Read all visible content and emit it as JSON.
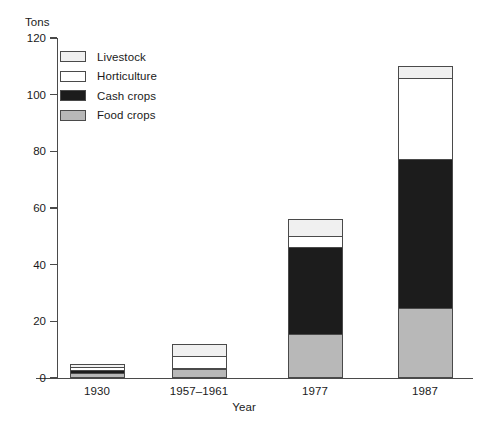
{
  "chart_data": {
    "type": "bar",
    "subtype": "stacked-bar",
    "title": "",
    "xlabel": "Year",
    "ylabel": "Tons",
    "ylim": [
      0,
      120
    ],
    "yticks": [
      0,
      20,
      40,
      60,
      80,
      100,
      120
    ],
    "ytick_labels": [
      "0",
      "20",
      "40",
      "60",
      "80",
      "100",
      "120"
    ],
    "grid": false,
    "legend_position": "upper left",
    "categories": [
      "1930",
      "1957–1961",
      "1977",
      "1987"
    ],
    "series": [
      {
        "name": "Food crops",
        "color": "#b8b8b8",
        "values": [
          1.5,
          2.5,
          15.0,
          24.0
        ]
      },
      {
        "name": "Cash crops",
        "color": "#1c1c1c",
        "values": [
          0.8,
          0.6,
          31.0,
          53.0
        ]
      },
      {
        "name": "Horticulture",
        "color": "#ffffff",
        "values": [
          1.4,
          4.4,
          4.0,
          29.0
        ]
      },
      {
        "name": "Livestock",
        "color": "#f0f0f0",
        "values": [
          1.3,
          4.5,
          6.0,
          4.0
        ]
      }
    ],
    "totals": [
      5.0,
      12.0,
      56.0,
      110.0
    ]
  },
  "legend": {
    "items": [
      {
        "label": "Livestock",
        "color": "#f0f0f0"
      },
      {
        "label": "Horticulture",
        "color": "#ffffff"
      },
      {
        "label": "Cash crops",
        "color": "#1c1c1c"
      },
      {
        "label": "Food crops",
        "color": "#b8b8b8"
      }
    ]
  },
  "axis": {
    "y_unit": "Tons",
    "x_title": "Year"
  },
  "colors": {
    "axis": "#4a4a4a",
    "text": "#1a1a1a",
    "background": "#ffffff"
  }
}
